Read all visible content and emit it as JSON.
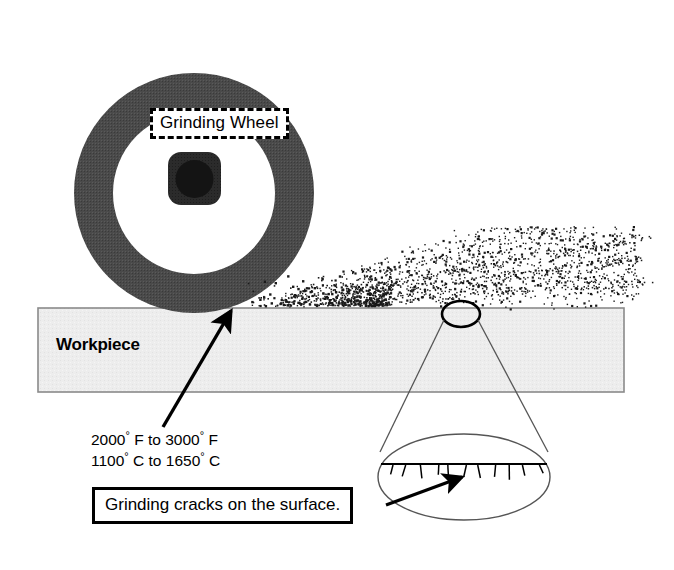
{
  "diagram": {
    "canvas": {
      "width": 674,
      "height": 570,
      "background": "#ffffff"
    }
  },
  "wheel": {
    "label": "Grinding Wheel",
    "ring_color": "#4a4a4a",
    "hub_color": "#2b2b2b",
    "bore_color": "#151515",
    "center_x": 194,
    "center_y": 193,
    "outer_radius": 119,
    "inner_radius": 78
  },
  "workpiece": {
    "label": "Workpiece",
    "fill_color": "#ededed",
    "border_color": "#8a8a8a",
    "x": 38,
    "y": 308,
    "width": 586,
    "height": 84
  },
  "sparks": {
    "name": "spark-stream",
    "color": "#1a1a1a",
    "origin_x": 248,
    "origin_y": 305
  },
  "temperature": {
    "line1_value": "2000",
    "line1_to": " F to ",
    "line1_end": "3000",
    "line1_unit": " F",
    "fahrenheit": "2000° F to 3000° F",
    "celsius": "1100° C to 1650° C",
    "degree_symbol": "°"
  },
  "callout": {
    "cracks_text": "Grinding cracks on the surface."
  },
  "magnifier": {
    "focus_circle": {
      "cx": 461,
      "cy": 314,
      "rx": 19,
      "ry": 13
    },
    "detail_ellipse": {
      "cx": 464,
      "cy": 477,
      "rx": 86,
      "ry": 43
    },
    "surface_line_y": 464,
    "crack_count": 11
  },
  "arrows": [
    {
      "name": "contact-point-arrow",
      "from_x": 163,
      "from_y": 427,
      "to_x": 233,
      "to_y": 308
    },
    {
      "name": "cracks-arrow",
      "from_x": 385,
      "from_y": 504,
      "to_x": 464,
      "to_y": 476
    }
  ],
  "colors": {
    "ink": "#000000",
    "wheel_gray": "#4a4a4a",
    "workpiece_gray": "#ededed",
    "outline_gray": "#8a8a8a"
  }
}
